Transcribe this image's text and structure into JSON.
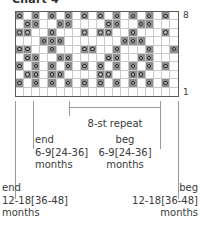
{
  "title": "Chart 4",
  "chart_data": {
    "type": "table",
    "title": "Chart 4",
    "subtitle": "Knitting stitch chart",
    "columns": 20,
    "rows": 10,
    "row_label_top": "8",
    "row_label_bottom": "1",
    "symbol_name": "yarn-over-circle",
    "colors": {
      "grid_border": "#5a5a5a",
      "cell_line": "#c9c9c9",
      "cell_white": "#ffffff",
      "cell_gray": "#8f8f8f",
      "symbol_stroke": "#3d3d3d",
      "text": "#3a3a3a",
      "tick": "#9a9a9a"
    },
    "legend": [
      {
        "key": "white",
        "label": "white cell"
      },
      {
        "key": "gray",
        "label": "gray cell"
      },
      {
        "key": "circle",
        "label": "circle symbol"
      }
    ],
    "cells": [
      [
        {
          "f": "gray",
          "s": true
        },
        {
          "f": "white",
          "s": false
        },
        {
          "f": "gray",
          "s": true
        },
        {
          "f": "white",
          "s": false
        },
        {
          "f": "gray",
          "s": true
        },
        {
          "f": "white",
          "s": false
        },
        {
          "f": "gray",
          "s": true
        },
        {
          "f": "white",
          "s": false
        },
        {
          "f": "gray",
          "s": true
        },
        {
          "f": "white",
          "s": false
        },
        {
          "f": "gray",
          "s": true
        },
        {
          "f": "white",
          "s": false
        },
        {
          "f": "gray",
          "s": true
        },
        {
          "f": "white",
          "s": false
        },
        {
          "f": "gray",
          "s": true
        },
        {
          "f": "white",
          "s": false
        },
        {
          "f": "gray",
          "s": true
        },
        {
          "f": "white",
          "s": false
        },
        {
          "f": "gray",
          "s": true
        },
        {
          "f": "white",
          "s": false
        }
      ],
      [
        {
          "f": "white",
          "s": false
        },
        {
          "f": "gray",
          "s": true
        },
        {
          "f": "gray",
          "s": true
        },
        {
          "f": "white",
          "s": false
        },
        {
          "f": "white",
          "s": false
        },
        {
          "f": "gray",
          "s": true
        },
        {
          "f": "gray",
          "s": true
        },
        {
          "f": "white",
          "s": false
        },
        {
          "f": "white",
          "s": false
        },
        {
          "f": "white",
          "s": false
        },
        {
          "f": "white",
          "s": false
        },
        {
          "f": "gray",
          "s": true
        },
        {
          "f": "gray",
          "s": true
        },
        {
          "f": "white",
          "s": false
        },
        {
          "f": "white",
          "s": false
        },
        {
          "f": "gray",
          "s": true
        },
        {
          "f": "gray",
          "s": true
        },
        {
          "f": "white",
          "s": false
        },
        {
          "f": "white",
          "s": false
        },
        {
          "f": "white",
          "s": false
        }
      ],
      [
        {
          "f": "gray",
          "s": true
        },
        {
          "f": "gray",
          "s": true
        },
        {
          "f": "white",
          "s": false
        },
        {
          "f": "white",
          "s": false
        },
        {
          "f": "gray",
          "s": true
        },
        {
          "f": "white",
          "s": false
        },
        {
          "f": "white",
          "s": false
        },
        {
          "f": "white",
          "s": false
        },
        {
          "f": "gray",
          "s": true
        },
        {
          "f": "white",
          "s": false
        },
        {
          "f": "gray",
          "s": true
        },
        {
          "f": "gray",
          "s": true
        },
        {
          "f": "white",
          "s": false
        },
        {
          "f": "white",
          "s": false
        },
        {
          "f": "gray",
          "s": true
        },
        {
          "f": "white",
          "s": false
        },
        {
          "f": "white",
          "s": false
        },
        {
          "f": "white",
          "s": false
        },
        {
          "f": "gray",
          "s": true
        },
        {
          "f": "white",
          "s": false
        }
      ],
      [
        {
          "f": "white",
          "s": false
        },
        {
          "f": "white",
          "s": false
        },
        {
          "f": "white",
          "s": false
        },
        {
          "f": "gray",
          "s": true
        },
        {
          "f": "gray",
          "s": true
        },
        {
          "f": "gray",
          "s": true
        },
        {
          "f": "white",
          "s": false
        },
        {
          "f": "white",
          "s": false
        },
        {
          "f": "white",
          "s": false
        },
        {
          "f": "white",
          "s": false
        },
        {
          "f": "white",
          "s": false
        },
        {
          "f": "white",
          "s": false
        },
        {
          "f": "white",
          "s": false
        },
        {
          "f": "gray",
          "s": true
        },
        {
          "f": "gray",
          "s": true
        },
        {
          "f": "gray",
          "s": true
        },
        {
          "f": "white",
          "s": false
        },
        {
          "f": "white",
          "s": false
        },
        {
          "f": "white",
          "s": false
        },
        {
          "f": "white",
          "s": false
        }
      ],
      [
        {
          "f": "gray",
          "s": true
        },
        {
          "f": "gray",
          "s": true
        },
        {
          "f": "white",
          "s": false
        },
        {
          "f": "white",
          "s": false
        },
        {
          "f": "gray",
          "s": true
        },
        {
          "f": "white",
          "s": false
        },
        {
          "f": "white",
          "s": false
        },
        {
          "f": "white",
          "s": false
        },
        {
          "f": "gray",
          "s": true
        },
        {
          "f": "gray",
          "s": true
        },
        {
          "f": "white",
          "s": false
        },
        {
          "f": "white",
          "s": false
        },
        {
          "f": "gray",
          "s": true
        },
        {
          "f": "white",
          "s": false
        },
        {
          "f": "white",
          "s": false
        },
        {
          "f": "white",
          "s": false
        },
        {
          "f": "gray",
          "s": true
        },
        {
          "f": "white",
          "s": false
        },
        {
          "f": "white",
          "s": false
        },
        {
          "f": "gray",
          "s": true
        }
      ],
      [
        {
          "f": "white",
          "s": false
        },
        {
          "f": "gray",
          "s": true
        },
        {
          "f": "gray",
          "s": true
        },
        {
          "f": "white",
          "s": false
        },
        {
          "f": "white",
          "s": false
        },
        {
          "f": "gray",
          "s": true
        },
        {
          "f": "gray",
          "s": true
        },
        {
          "f": "white",
          "s": false
        },
        {
          "f": "white",
          "s": false
        },
        {
          "f": "white",
          "s": false
        },
        {
          "f": "white",
          "s": false
        },
        {
          "f": "gray",
          "s": true
        },
        {
          "f": "gray",
          "s": true
        },
        {
          "f": "white",
          "s": false
        },
        {
          "f": "white",
          "s": false
        },
        {
          "f": "gray",
          "s": true
        },
        {
          "f": "gray",
          "s": true
        },
        {
          "f": "white",
          "s": false
        },
        {
          "f": "white",
          "s": false
        },
        {
          "f": "white",
          "s": false
        }
      ],
      [
        {
          "f": "gray",
          "s": true
        },
        {
          "f": "white",
          "s": false
        },
        {
          "f": "gray",
          "s": true
        },
        {
          "f": "white",
          "s": false
        },
        {
          "f": "gray",
          "s": true
        },
        {
          "f": "white",
          "s": false
        },
        {
          "f": "gray",
          "s": true
        },
        {
          "f": "white",
          "s": false
        },
        {
          "f": "gray",
          "s": true
        },
        {
          "f": "white",
          "s": false
        },
        {
          "f": "gray",
          "s": true
        },
        {
          "f": "white",
          "s": false
        },
        {
          "f": "gray",
          "s": true
        },
        {
          "f": "white",
          "s": false
        },
        {
          "f": "gray",
          "s": true
        },
        {
          "f": "white",
          "s": false
        },
        {
          "f": "gray",
          "s": true
        },
        {
          "f": "white",
          "s": false
        },
        {
          "f": "gray",
          "s": true
        },
        {
          "f": "white",
          "s": false
        }
      ],
      [
        {
          "f": "white",
          "s": false
        },
        {
          "f": "gray",
          "s": true
        },
        {
          "f": "gray",
          "s": true
        },
        {
          "f": "white",
          "s": false
        },
        {
          "f": "gray",
          "s": true
        },
        {
          "f": "gray",
          "s": true
        },
        {
          "f": "white",
          "s": false
        },
        {
          "f": "white",
          "s": false
        },
        {
          "f": "white",
          "s": false
        },
        {
          "f": "white",
          "s": false
        },
        {
          "f": "gray",
          "s": true
        },
        {
          "f": "gray",
          "s": true
        },
        {
          "f": "white",
          "s": false
        },
        {
          "f": "white",
          "s": false
        },
        {
          "f": "gray",
          "s": true
        },
        {
          "f": "gray",
          "s": true
        },
        {
          "f": "white",
          "s": false
        },
        {
          "f": "white",
          "s": false
        },
        {
          "f": "white",
          "s": false
        },
        {
          "f": "white",
          "s": false
        }
      ],
      [
        {
          "f": "gray",
          "s": true
        },
        {
          "f": "white",
          "s": false
        },
        {
          "f": "gray",
          "s": true
        },
        {
          "f": "white",
          "s": false
        },
        {
          "f": "gray",
          "s": true
        },
        {
          "f": "white",
          "s": false
        },
        {
          "f": "gray",
          "s": true
        },
        {
          "f": "white",
          "s": false
        },
        {
          "f": "gray",
          "s": true
        },
        {
          "f": "white",
          "s": false
        },
        {
          "f": "gray",
          "s": true
        },
        {
          "f": "white",
          "s": false
        },
        {
          "f": "gray",
          "s": true
        },
        {
          "f": "white",
          "s": false
        },
        {
          "f": "gray",
          "s": true
        },
        {
          "f": "white",
          "s": false
        },
        {
          "f": "gray",
          "s": true
        },
        {
          "f": "white",
          "s": false
        },
        {
          "f": "gray",
          "s": true
        },
        {
          "f": "white",
          "s": false
        }
      ],
      [
        {
          "f": "white",
          "s": false
        },
        {
          "f": "white",
          "s": false
        },
        {
          "f": "white",
          "s": false
        },
        {
          "f": "white",
          "s": false
        },
        {
          "f": "white",
          "s": false
        },
        {
          "f": "white",
          "s": false
        },
        {
          "f": "white",
          "s": false
        },
        {
          "f": "white",
          "s": false
        },
        {
          "f": "white",
          "s": false
        },
        {
          "f": "white",
          "s": false
        },
        {
          "f": "white",
          "s": false
        },
        {
          "f": "white",
          "s": false
        },
        {
          "f": "white",
          "s": false
        },
        {
          "f": "white",
          "s": false
        },
        {
          "f": "white",
          "s": false
        },
        {
          "f": "white",
          "s": false
        },
        {
          "f": "white",
          "s": false
        },
        {
          "f": "white",
          "s": false
        },
        {
          "f": "white",
          "s": false
        },
        {
          "f": "white",
          "s": false
        }
      ]
    ]
  },
  "repeat": {
    "label": "8-st repeat"
  },
  "annotations": {
    "inner_left": {
      "line1": "end",
      "line2": "6-9[24-36]",
      "line3": "months"
    },
    "inner_right": {
      "line1": "beg",
      "line2": "6-9[24-36]",
      "line3": "months"
    },
    "outer_left": {
      "line1": "end",
      "line2": "12-18[36-48]",
      "line3": "months"
    },
    "outer_right": {
      "line1": "beg",
      "line2": "12-18[36-48]",
      "line3": "months"
    }
  }
}
